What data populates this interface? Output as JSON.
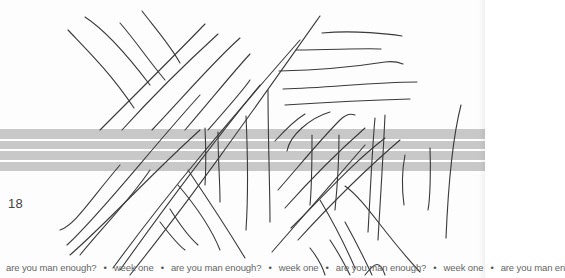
{
  "page": {
    "number": "18",
    "band_color": "#c8c8c8",
    "stroke_color": "#3a3a3a",
    "footer": {
      "items": [
        "are you man enough?",
        "week one",
        "are you man enough?",
        "week one",
        "are you man enough?",
        "week one",
        "are you man en"
      ],
      "separator": "•"
    }
  }
}
